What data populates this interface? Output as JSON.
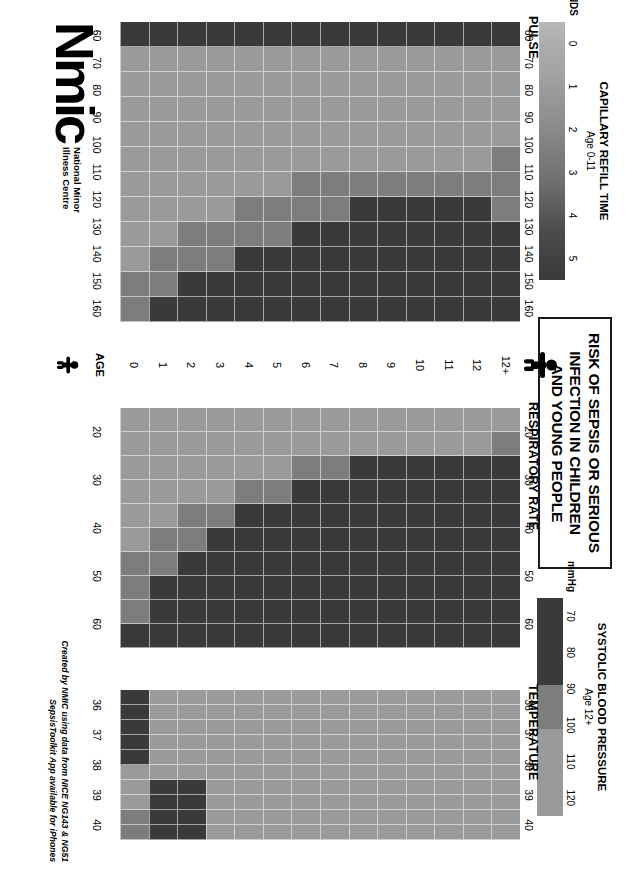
{
  "poster": {
    "title_lines": [
      "RISK OF SEPSIS OR SERIOUS",
      "INFECTION IN CHILDREN",
      "AND YOUNG PEOPLE"
    ],
    "age_axis_label": "AGE",
    "attribution_line1": "Created by NMIC using data from NICE NG143 & NG51",
    "attribution_line2": "SepsisToolkit App available for iPhones",
    "logo_wordmark": "Nmic",
    "logo_sub_line1": "National Minor",
    "logo_sub_line2": "Illness Centre",
    "adult_figure_icon": "adult-person-icon",
    "child_figure_icon": "child-person-icon"
  },
  "colors": {
    "green": "#9a9a9a",
    "amber": "#7d7d7d",
    "red": "#3a3a3a",
    "grid_line": "#ffffff",
    "text": "#000000",
    "border": "#1a1a1a"
  },
  "legends": {
    "capillary_refill": {
      "title": "CAPILLARY REFILL TIME",
      "subtitle": "Age 0-11",
      "unit_label": "SECONDS",
      "ticks": [
        "0",
        "1",
        "2",
        "3",
        "4",
        "5"
      ],
      "gradient_from": "#b6b6b6",
      "gradient_to": "#3a3a3a"
    },
    "systolic_bp": {
      "title": "SYSTOLIC BLOOD PRESSURE",
      "subtitle": "Age 12+",
      "unit_label": "mmHg",
      "ticks": [
        "70",
        "80",
        "90",
        "100",
        "110",
        "120"
      ],
      "segments": [
        {
          "label": "70-90",
          "color": "#3a3a3a",
          "span": 2
        },
        {
          "label": "90-100",
          "color": "#7d7d7d",
          "span": 1
        },
        {
          "label": "100-120",
          "color": "#9a9a9a",
          "span": 2
        }
      ]
    }
  },
  "chart_data": [
    {
      "type": "heatmap",
      "title": "PULSE",
      "xlabel": "",
      "ylabel": "AGE",
      "x_ticks": [
        "60",
        "70",
        "80",
        "90",
        "100",
        "110",
        "120",
        "130",
        "140",
        "150",
        "160"
      ],
      "x_range": [
        55,
        165
      ],
      "x_bin_width": 10,
      "categories": [
        "12+",
        "12",
        "11",
        "10",
        "9",
        "8",
        "7",
        "6",
        "5",
        "4",
        "3",
        "2",
        "1",
        "0"
      ],
      "legend": [
        "green",
        "amber",
        "red"
      ],
      "cell_colors": [
        [
          "red",
          "green",
          "green",
          "green",
          "green",
          "amber",
          "amber",
          "amber",
          "red",
          "red",
          "red",
          "red"
        ],
        [
          "red",
          "green",
          "green",
          "green",
          "green",
          "green",
          "amber",
          "red",
          "red",
          "red",
          "red",
          "red"
        ],
        [
          "red",
          "green",
          "green",
          "green",
          "green",
          "green",
          "amber",
          "red",
          "red",
          "red",
          "red",
          "red"
        ],
        [
          "red",
          "green",
          "green",
          "green",
          "green",
          "green",
          "amber",
          "red",
          "red",
          "red",
          "red",
          "red"
        ],
        [
          "red",
          "green",
          "green",
          "green",
          "green",
          "green",
          "amber",
          "red",
          "red",
          "red",
          "red",
          "red"
        ],
        [
          "red",
          "green",
          "green",
          "green",
          "green",
          "green",
          "amber",
          "red",
          "red",
          "red",
          "red",
          "red"
        ],
        [
          "red",
          "green",
          "green",
          "green",
          "green",
          "green",
          "amber",
          "amber",
          "red",
          "red",
          "red",
          "red"
        ],
        [
          "red",
          "green",
          "green",
          "green",
          "green",
          "green",
          "amber",
          "amber",
          "red",
          "red",
          "red",
          "red"
        ],
        [
          "red",
          "green",
          "green",
          "green",
          "green",
          "green",
          "green",
          "amber",
          "amber",
          "red",
          "red",
          "red"
        ],
        [
          "red",
          "green",
          "green",
          "green",
          "green",
          "green",
          "green",
          "amber",
          "amber",
          "red",
          "red",
          "red"
        ],
        [
          "red",
          "green",
          "green",
          "green",
          "green",
          "green",
          "green",
          "green",
          "amber",
          "amber",
          "red",
          "red"
        ],
        [
          "red",
          "green",
          "green",
          "green",
          "green",
          "green",
          "green",
          "green",
          "amber",
          "amber",
          "red",
          "red"
        ],
        [
          "red",
          "green",
          "green",
          "green",
          "green",
          "green",
          "green",
          "green",
          "green",
          "amber",
          "amber",
          "red"
        ],
        [
          "red",
          "green",
          "green",
          "green",
          "green",
          "green",
          "green",
          "green",
          "green",
          "green",
          "amber",
          "amber"
        ]
      ]
    },
    {
      "type": "heatmap",
      "title": "RESPIRATORY RATE",
      "xlabel": "",
      "ylabel": "AGE",
      "x_ticks": [
        "20",
        "30",
        "40",
        "50",
        "60"
      ],
      "x_range": [
        15,
        65
      ],
      "x_bin_width": 5,
      "categories": [
        "12+",
        "12",
        "11",
        "10",
        "9",
        "8",
        "7",
        "6",
        "5",
        "4",
        "3",
        "2",
        "1",
        "0"
      ],
      "legend": [
        "green",
        "amber",
        "red"
      ],
      "cell_colors": [
        [
          "green",
          "amber",
          "red",
          "red",
          "red",
          "red",
          "red",
          "red",
          "red",
          "red"
        ],
        [
          "green",
          "green",
          "red",
          "red",
          "red",
          "red",
          "red",
          "red",
          "red",
          "red"
        ],
        [
          "green",
          "green",
          "red",
          "red",
          "red",
          "red",
          "red",
          "red",
          "red",
          "red"
        ],
        [
          "green",
          "green",
          "red",
          "red",
          "red",
          "red",
          "red",
          "red",
          "red",
          "red"
        ],
        [
          "green",
          "green",
          "red",
          "red",
          "red",
          "red",
          "red",
          "red",
          "red",
          "red"
        ],
        [
          "green",
          "green",
          "red",
          "red",
          "red",
          "red",
          "red",
          "red",
          "red",
          "red"
        ],
        [
          "green",
          "green",
          "amber",
          "red",
          "red",
          "red",
          "red",
          "red",
          "red",
          "red"
        ],
        [
          "green",
          "green",
          "amber",
          "red",
          "red",
          "red",
          "red",
          "red",
          "red",
          "red"
        ],
        [
          "green",
          "green",
          "green",
          "amber",
          "red",
          "red",
          "red",
          "red",
          "red",
          "red"
        ],
        [
          "green",
          "green",
          "green",
          "amber",
          "red",
          "red",
          "red",
          "red",
          "red",
          "red"
        ],
        [
          "green",
          "green",
          "green",
          "green",
          "amber",
          "red",
          "red",
          "red",
          "red",
          "red"
        ],
        [
          "green",
          "green",
          "green",
          "green",
          "amber",
          "amber",
          "red",
          "red",
          "red",
          "red"
        ],
        [
          "green",
          "green",
          "green",
          "green",
          "green",
          "amber",
          "amber",
          "red",
          "red",
          "red"
        ],
        [
          "green",
          "green",
          "green",
          "green",
          "green",
          "green",
          "amber",
          "amber",
          "amber",
          "red"
        ]
      ]
    },
    {
      "type": "heatmap",
      "title": "TEMPERATURE",
      "xlabel": "",
      "ylabel": "AGE",
      "x_ticks": [
        "36",
        "37",
        "38",
        "39",
        "40"
      ],
      "x_range": [
        35.5,
        40.5
      ],
      "x_bin_width": 0.5,
      "categories": [
        "12+",
        "12",
        "11",
        "10",
        "9",
        "8",
        "7",
        "6",
        "5",
        "4",
        "3",
        "2",
        "1",
        "0"
      ],
      "legend": [
        "green",
        "amber",
        "red"
      ],
      "cell_colors": [
        [
          "green",
          "green",
          "green",
          "green",
          "green",
          "green",
          "green",
          "green",
          "green",
          "green"
        ],
        [
          "green",
          "green",
          "green",
          "green",
          "green",
          "green",
          "green",
          "green",
          "green",
          "green"
        ],
        [
          "green",
          "green",
          "green",
          "green",
          "green",
          "green",
          "green",
          "green",
          "green",
          "green"
        ],
        [
          "green",
          "green",
          "green",
          "green",
          "green",
          "green",
          "green",
          "green",
          "green",
          "green"
        ],
        [
          "green",
          "green",
          "green",
          "green",
          "green",
          "green",
          "green",
          "green",
          "green",
          "green"
        ],
        [
          "green",
          "green",
          "green",
          "green",
          "green",
          "green",
          "green",
          "green",
          "green",
          "green"
        ],
        [
          "green",
          "green",
          "green",
          "green",
          "green",
          "green",
          "green",
          "green",
          "green",
          "green"
        ],
        [
          "green",
          "green",
          "green",
          "green",
          "green",
          "green",
          "green",
          "green",
          "green",
          "green"
        ],
        [
          "green",
          "green",
          "green",
          "green",
          "green",
          "green",
          "green",
          "green",
          "green",
          "green"
        ],
        [
          "green",
          "green",
          "green",
          "green",
          "green",
          "green",
          "green",
          "green",
          "green",
          "green"
        ],
        [
          "green",
          "green",
          "green",
          "green",
          "green",
          "green",
          "green",
          "green",
          "green",
          "green"
        ],
        [
          "green",
          "green",
          "green",
          "green",
          "green",
          "green",
          "red",
          "red",
          "red",
          "red"
        ],
        [
          "green",
          "green",
          "green",
          "green",
          "green",
          "green",
          "red",
          "red",
          "red",
          "red"
        ],
        [
          "red",
          "red",
          "red",
          "red",
          "red",
          "green",
          "green",
          "green",
          "amber",
          "amber"
        ]
      ]
    }
  ]
}
